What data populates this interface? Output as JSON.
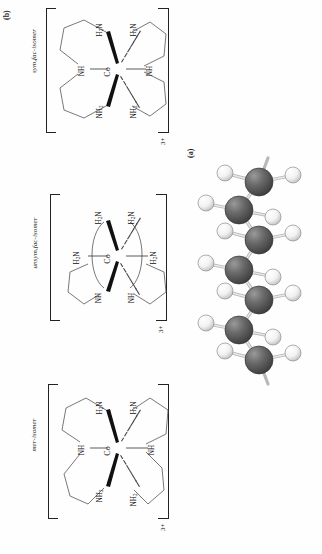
{
  "figure": {
    "panel_a_label": "(a)",
    "panel_b_label": "(b)",
    "background_color": "#fefefe",
    "carbon_color": "#5a5a5a",
    "hydrogen_color": "#ffffff",
    "bond_color": "#c9c9c9"
  },
  "panel_a": {
    "caption": "(a)",
    "model_type": "ball-and-stick",
    "description": "zigzag hydrocarbon chain",
    "carbon_count": 7,
    "hydrogen_count": 14,
    "atom_names": [
      "carbon-atom",
      "hydrogen-atom"
    ]
  },
  "panel_b": {
    "caption": "(b)",
    "structures": [
      {
        "name": "sym,fac-isomer",
        "metal": "Co",
        "charge": "3+",
        "donor_labels": {
          "upper_left": "H2N",
          "upper_right": "H2N",
          "left": "NH",
          "right": "NH",
          "lower_left": "NH2",
          "lower_right": "NH2"
        },
        "donor_label_display": {
          "upper_left": "H₂N",
          "upper_right": "H₂N",
          "left": "NH",
          "right": "NH",
          "lower_left": "NH₂",
          "lower_right": "NH₂"
        }
      },
      {
        "name": "unsym,fac-isomer",
        "metal": "Co",
        "charge": "3+",
        "donor_labels": {
          "upper_left": "H2N",
          "upper_right": "H2N",
          "left": "H2N",
          "right": "H2N",
          "lower_left": "NH",
          "lower_right": "NH"
        },
        "donor_label_display": {
          "upper_left": "H₂N",
          "upper_right": "H₂N",
          "left": "H₂N",
          "right": "H₂N",
          "lower_left": "NH",
          "lower_right": "NH"
        }
      },
      {
        "name": "mer-isomer",
        "metal": "Co",
        "charge": "3+",
        "donor_labels": {
          "upper_left": "H2N",
          "upper_right": "H2N",
          "left": "NH",
          "right": "NH",
          "lower_left": "NH2",
          "lower_right": "NH2"
        },
        "donor_label_display": {
          "upper_left": "H₂N",
          "upper_right": "H₂N",
          "left": "NH",
          "right": "NH",
          "lower_left": "NH₂",
          "lower_right": "NH₂"
        }
      }
    ]
  }
}
